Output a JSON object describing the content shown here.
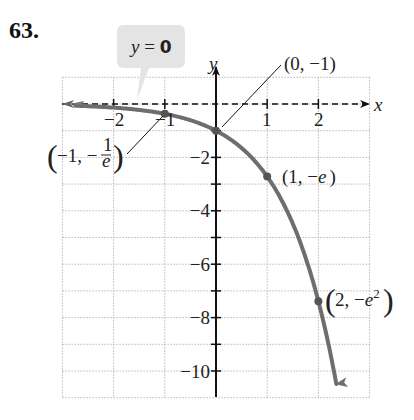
{
  "problem": {
    "number": "63."
  },
  "callout": {
    "text_var": "y",
    "text_eq": " = ",
    "text_val": "0",
    "fill": "#e4e4e4"
  },
  "chart_data": {
    "type": "line",
    "function": "y = -e^x",
    "title": "",
    "xlabel": "x",
    "ylabel": "y",
    "xlim": [
      -3,
      3
    ],
    "ylim": [
      -11,
      1
    ],
    "grid": true,
    "x_ticks": [
      -2,
      -1,
      1,
      2
    ],
    "x_tick_labels": [
      "−2",
      "−1",
      "1",
      "2"
    ],
    "y_ticks": [
      -1,
      -2,
      -3,
      -4,
      -5,
      -6,
      -7,
      -8,
      -9,
      -10
    ],
    "y_tick_labels": [
      "−2",
      "−4",
      "−6",
      "−8",
      "−10"
    ],
    "asymptote": {
      "label": "y = 0",
      "y": 0,
      "style": "dashed"
    },
    "curve_color": "#6e6e6e",
    "points": [
      {
        "x": -1,
        "y": -0.368,
        "label": "(−1, −1/e)"
      },
      {
        "x": 0,
        "y": -1,
        "label": "(0, −1)"
      },
      {
        "x": 1,
        "y": -2.718,
        "label": "(1, −e)"
      },
      {
        "x": 2,
        "y": -7.389,
        "label": "(2, −e²)"
      }
    ]
  },
  "labels": {
    "x_axis": "x",
    "y_axis": "y",
    "xt_m2": "−2",
    "xt_m1": "−1",
    "xt_1": "1",
    "xt_2": "2",
    "yt_m2": "−2",
    "yt_m4": "−4",
    "yt_m6": "−6",
    "yt_m8": "−8",
    "yt_m10": "−10",
    "p0": "(0, −1)",
    "p1": "(1, −",
    "p1_e": "e",
    "p1_close": ")",
    "pm1_open": "−1, −",
    "pm1_num": "1",
    "pm1_den": "e",
    "p2_open": "2, −",
    "p2_e": "e",
    "p2_sup": "2"
  }
}
